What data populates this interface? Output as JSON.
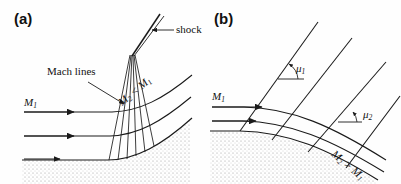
{
  "figure": {
    "type": "diagram",
    "background_color": "#fefefe",
    "line_color": "#1a1a1a",
    "wall_fill_color": "#c9c9c9"
  },
  "panels": [
    {
      "id": "a",
      "label": "(a)",
      "kind": "compression",
      "wall": "concave",
      "labels": {
        "inflow_mach": "M",
        "inflow_mach_sub": "1",
        "mach_lines": "Mach lines",
        "shock": "shock",
        "downstream_relation_lead": "M",
        "downstream_relation_lead_sub": "2",
        "downstream_relation_op": " < ",
        "downstream_relation_trail": "M",
        "downstream_relation_trail_sub": "1"
      }
    },
    {
      "id": "b",
      "label": "(b)",
      "kind": "expansion",
      "wall": "convex",
      "labels": {
        "inflow_mach": "M",
        "inflow_mach_sub": "1",
        "mach_angle_1": "μ",
        "mach_angle_1_sub": "1",
        "mach_angle_2": "μ",
        "mach_angle_2_sub": "2",
        "downstream_relation_lead": "M",
        "downstream_relation_lead_sub": "2",
        "downstream_relation_op": " > ",
        "downstream_relation_trail": "M",
        "downstream_relation_trail_sub": "1"
      }
    }
  ]
}
